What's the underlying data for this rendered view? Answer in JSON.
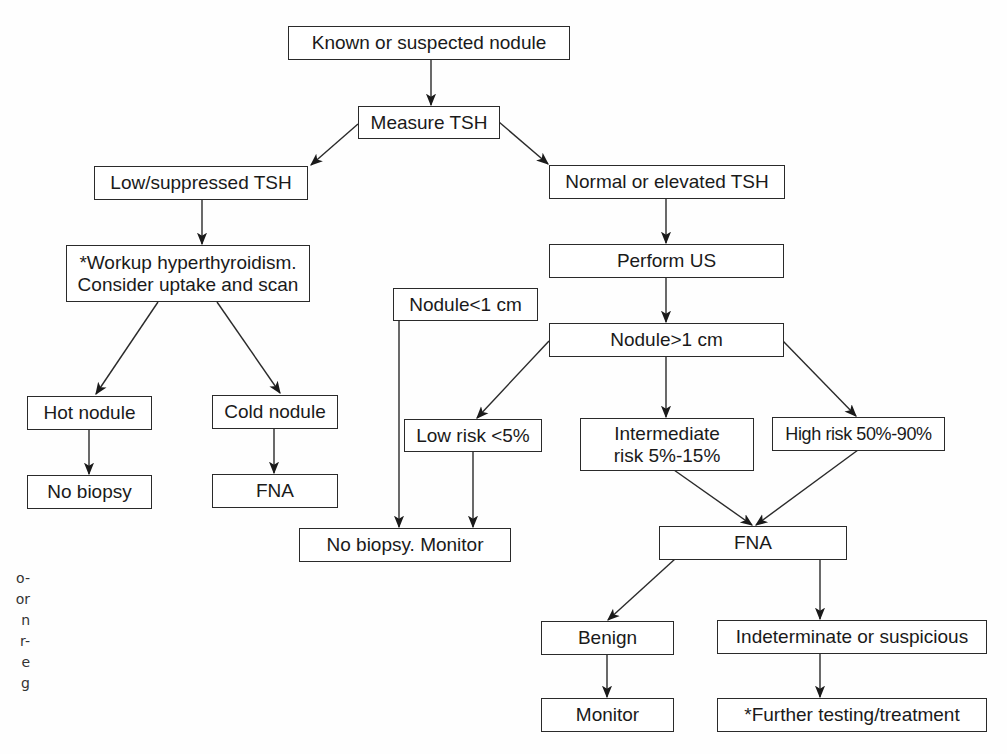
{
  "diagram": {
    "type": "flowchart",
    "nodes": [
      {
        "id": "known",
        "label": "Known or suspected nodule"
      },
      {
        "id": "tsh",
        "label": "Measure TSH"
      },
      {
        "id": "low_tsh",
        "label": "Low/suppressed TSH"
      },
      {
        "id": "normal_tsh",
        "label": "Normal or elevated TSH"
      },
      {
        "id": "workup",
        "label": "*Workup hyperthyroidism.\nConsider uptake and scan"
      },
      {
        "id": "perform_us",
        "label": "Perform US"
      },
      {
        "id": "nodule_small",
        "label": "Nodule<1 cm"
      },
      {
        "id": "nodule_large",
        "label": "Nodule>1 cm"
      },
      {
        "id": "hot",
        "label": "Hot nodule"
      },
      {
        "id": "cold",
        "label": "Cold nodule"
      },
      {
        "id": "low_risk",
        "label": "Low risk <5%"
      },
      {
        "id": "intermediate",
        "label": "Intermediate\nrisk 5%-15%"
      },
      {
        "id": "high_risk",
        "label": "High risk 50%-90%"
      },
      {
        "id": "no_biopsy",
        "label": "No biopsy"
      },
      {
        "id": "fna_left",
        "label": "FNA"
      },
      {
        "id": "no_biopsy_monitor",
        "label": "No biopsy. Monitor"
      },
      {
        "id": "fna_right",
        "label": "FNA"
      },
      {
        "id": "benign",
        "label": "Benign"
      },
      {
        "id": "indeterminate",
        "label": "Indeterminate or suspicious"
      },
      {
        "id": "monitor",
        "label": "Monitor"
      },
      {
        "id": "further",
        "label": "*Further testing/treatment"
      }
    ],
    "edges": [
      [
        "known",
        "tsh"
      ],
      [
        "tsh",
        "low_tsh"
      ],
      [
        "tsh",
        "normal_tsh"
      ],
      [
        "low_tsh",
        "workup"
      ],
      [
        "normal_tsh",
        "perform_us"
      ],
      [
        "perform_us",
        "nodule_large"
      ],
      [
        "workup",
        "hot"
      ],
      [
        "workup",
        "cold"
      ],
      [
        "hot",
        "no_biopsy"
      ],
      [
        "cold",
        "fna_left"
      ],
      [
        "nodule_small",
        "no_biopsy_monitor"
      ],
      [
        "nodule_large",
        "low_risk"
      ],
      [
        "nodule_large",
        "intermediate"
      ],
      [
        "nodule_large",
        "high_risk"
      ],
      [
        "low_risk",
        "no_biopsy_monitor"
      ],
      [
        "intermediate",
        "fna_right"
      ],
      [
        "high_risk",
        "fna_right"
      ],
      [
        "fna_right",
        "benign"
      ],
      [
        "fna_right",
        "indeterminate"
      ],
      [
        "benign",
        "monitor"
      ],
      [
        "indeterminate",
        "further"
      ]
    ]
  },
  "caption_fragments": [
    "o-",
    "or",
    "n",
    "r-",
    "e",
    "g"
  ],
  "colors": {
    "line": "#2a2a2a",
    "text": "#1a1a1a",
    "background": "#ffffff"
  }
}
